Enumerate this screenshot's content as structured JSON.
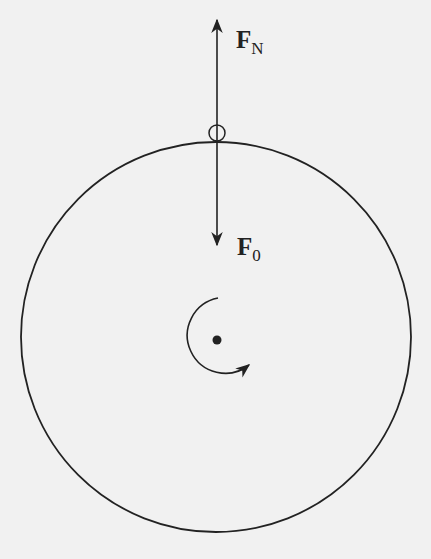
{
  "diagram": {
    "labels": {
      "normal_force": {
        "main": "F",
        "sub": "N"
      },
      "downward_force": {
        "main": "F",
        "sub": "0"
      }
    },
    "elements": [
      "large-circle",
      "small-object-circle",
      "upward-arrow",
      "downward-arrow",
      "center-dot",
      "rotation-arrow-clockwise"
    ],
    "colors": {
      "stroke": "#222222",
      "background": "#f1f1f1"
    }
  }
}
